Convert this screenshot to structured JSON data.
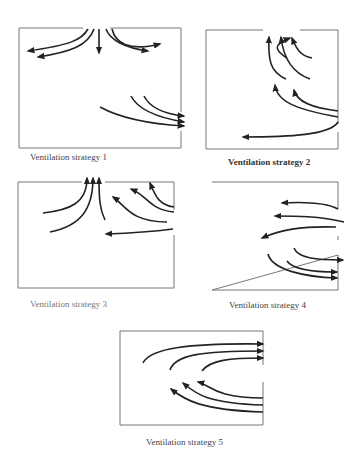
{
  "figure": {
    "panels": [
      {
        "id": 1,
        "caption": "Ventilation strategy 1",
        "description": "Supply from ceiling center spreads downward/sideways; exhaust flows out lower right wall"
      },
      {
        "id": 2,
        "caption": "Ventilation strategy 2",
        "description": "Air enters right wall, curls up to ceiling exhaust; lower stream flows left across floor"
      },
      {
        "id": 3,
        "caption": "Ventilation strategy 3",
        "description": "Air converges to ceiling exhaust; supply from right wall"
      },
      {
        "id": 4,
        "caption": "Ventilation strategy 4",
        "description": "Upper streams enter right wall flowing left; lower streams return and exit right"
      },
      {
        "id": 5,
        "caption": "Ventilation strategy 5",
        "description": "Lower streams enter right wall and curl back up; upper streams exit right"
      }
    ],
    "colors": {
      "line": "#222222",
      "frame": "#777777",
      "background": "#ffffff"
    }
  }
}
